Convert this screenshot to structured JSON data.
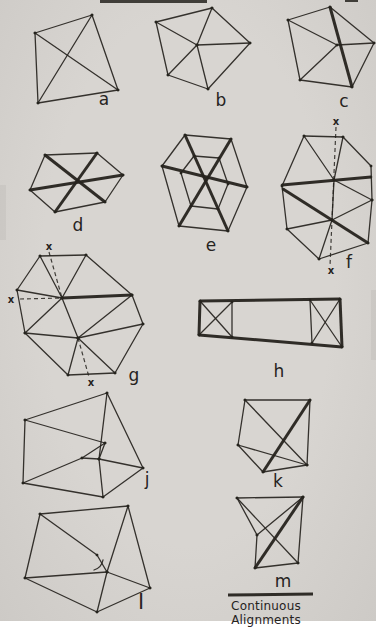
{
  "page": {
    "paper_color": "#d6d3cf",
    "ink_color": "#26231e"
  },
  "legend": {
    "label": "Continuous Alignments",
    "line": [
      228,
      595,
      313,
      594
    ]
  },
  "figures": [
    {
      "id": "a",
      "label": "a",
      "label_x": 104,
      "label_y": 99,
      "thin": [
        [
          92,
          15,
          35,
          33
        ],
        [
          35,
          33,
          38,
          103
        ],
        [
          38,
          103,
          118,
          90
        ],
        [
          118,
          90,
          92,
          15
        ],
        [
          92,
          15,
          38,
          103
        ],
        [
          35,
          33,
          118,
          90
        ]
      ]
    },
    {
      "id": "b",
      "label": "b",
      "label_x": 221,
      "label_y": 100,
      "thin": [
        [
          212,
          8,
          250,
          43
        ],
        [
          250,
          43,
          208,
          89
        ],
        [
          208,
          89,
          168,
          75
        ],
        [
          168,
          75,
          156,
          22
        ],
        [
          156,
          22,
          212,
          8
        ],
        [
          197,
          45,
          212,
          8
        ],
        [
          197,
          45,
          156,
          22
        ],
        [
          197,
          45,
          250,
          43
        ],
        [
          197,
          45,
          208,
          89
        ],
        [
          197,
          45,
          168,
          75
        ]
      ]
    },
    {
      "id": "c",
      "label": "c",
      "label_x": 344,
      "label_y": 101,
      "thin": [
        [
          330,
          7,
          374,
          43
        ],
        [
          374,
          43,
          352,
          87
        ],
        [
          352,
          87,
          300,
          80
        ],
        [
          300,
          80,
          288,
          20
        ],
        [
          288,
          20,
          330,
          7
        ],
        [
          337,
          45,
          288,
          20
        ],
        [
          337,
          45,
          374,
          43
        ],
        [
          337,
          45,
          300,
          80
        ]
      ],
      "thick": [
        [
          330,
          7,
          352,
          87
        ]
      ]
    },
    {
      "id": "d",
      "label": "d",
      "label_x": 78,
      "label_y": 225,
      "thin": [
        [
          45,
          155,
          97,
          153
        ],
        [
          97,
          153,
          123,
          175
        ],
        [
          123,
          175,
          105,
          202
        ],
        [
          105,
          202,
          55,
          212
        ],
        [
          55,
          212,
          30,
          190
        ],
        [
          30,
          190,
          45,
          155
        ]
      ],
      "thick": [
        [
          45,
          155,
          105,
          202
        ],
        [
          97,
          153,
          55,
          212
        ],
        [
          30,
          190,
          123,
          175
        ]
      ]
    },
    {
      "id": "e",
      "label": "e",
      "label_x": 211,
      "label_y": 245,
      "thin": [
        [
          185,
          135,
          231,
          139
        ],
        [
          231,
          139,
          247,
          187
        ],
        [
          247,
          187,
          228,
          231
        ],
        [
          228,
          231,
          179,
          226
        ],
        [
          179,
          226,
          162,
          166
        ],
        [
          162,
          166,
          185,
          135
        ],
        [
          194,
          156,
          219,
          158
        ],
        [
          219,
          158,
          228,
          184
        ],
        [
          228,
          184,
          218,
          209
        ],
        [
          218,
          209,
          191,
          206
        ],
        [
          191,
          206,
          181,
          173
        ],
        [
          181,
          173,
          194,
          156
        ]
      ],
      "thick": [
        [
          185,
          135,
          228,
          231
        ],
        [
          231,
          139,
          179,
          226
        ],
        [
          162,
          166,
          247,
          187
        ]
      ]
    },
    {
      "id": "f",
      "label": "f",
      "label_x": 349,
      "label_y": 262,
      "thin": [
        [
          304,
          136,
          343,
          137
        ],
        [
          343,
          137,
          371,
          166
        ],
        [
          371,
          166,
          372,
          200
        ],
        [
          372,
          200,
          368,
          243
        ],
        [
          368,
          243,
          319,
          259
        ],
        [
          319,
          259,
          287,
          229
        ],
        [
          287,
          229,
          282,
          186
        ],
        [
          282,
          186,
          304,
          136
        ],
        [
          334,
          180,
          304,
          136
        ],
        [
          334,
          180,
          343,
          137
        ],
        [
          334,
          180,
          372,
          200
        ],
        [
          334,
          180,
          332,
          220
        ],
        [
          332,
          220,
          372,
          200
        ],
        [
          332,
          220,
          319,
          259
        ],
        [
          332,
          220,
          287,
          229
        ]
      ],
      "thick": [
        [
          282,
          185,
          371,
          177
        ],
        [
          283,
          189,
          368,
          243
        ]
      ],
      "dashed": [
        [
          336,
          127,
          330,
          266
        ]
      ],
      "marks": [
        {
          "t": "x",
          "x": 336,
          "y": 121
        },
        {
          "t": "x",
          "x": 331,
          "y": 270
        }
      ]
    },
    {
      "id": "g",
      "label": "g",
      "label_x": 134,
      "label_y": 375,
      "thin": [
        [
          40,
          256,
          86,
          255
        ],
        [
          86,
          255,
          132,
          295
        ],
        [
          132,
          295,
          143,
          324
        ],
        [
          143,
          324,
          115,
          373
        ],
        [
          115,
          373,
          68,
          375
        ],
        [
          68,
          375,
          25,
          333
        ],
        [
          25,
          333,
          17,
          290
        ],
        [
          17,
          290,
          40,
          256
        ],
        [
          62,
          298,
          40,
          256
        ],
        [
          62,
          298,
          86,
          255
        ],
        [
          62,
          298,
          17,
          290
        ],
        [
          62,
          298,
          25,
          333
        ],
        [
          62,
          298,
          78,
          338
        ],
        [
          78,
          338,
          25,
          333
        ],
        [
          78,
          338,
          68,
          375
        ],
        [
          78,
          338,
          115,
          373
        ],
        [
          78,
          338,
          143,
          324
        ],
        [
          78,
          338,
          132,
          295
        ]
      ],
      "thick": [
        [
          62,
          298,
          132,
          295
        ]
      ],
      "dashed": [
        [
          49,
          252,
          62,
          298
        ],
        [
          20,
          299,
          62,
          298
        ],
        [
          78,
          338,
          89,
          377
        ]
      ],
      "marks": [
        {
          "t": "x",
          "x": 49,
          "y": 246
        },
        {
          "t": "x",
          "x": 11,
          "y": 299
        },
        {
          "t": "x",
          "x": 91,
          "y": 382
        }
      ]
    },
    {
      "id": "h",
      "label": "h",
      "label_x": 279,
      "label_y": 371,
      "thin": [
        [
          232,
          302,
          232,
          337
        ],
        [
          310,
          300,
          312,
          343
        ],
        [
          200,
          301,
          232,
          337
        ],
        [
          232,
          302,
          199,
          335
        ],
        [
          310,
          300,
          342,
          347
        ],
        [
          340,
          299,
          312,
          343
        ]
      ],
      "thick": [
        [
          200,
          301,
          340,
          299
        ],
        [
          340,
          299,
          342,
          347
        ],
        [
          342,
          347,
          199,
          335
        ],
        [
          199,
          335,
          200,
          301
        ]
      ]
    },
    {
      "id": "j",
      "label": "j",
      "label_x": 147,
      "label_y": 479,
      "thin": [
        [
          107,
          393,
          25,
          420
        ],
        [
          25,
          420,
          23,
          483
        ],
        [
          23,
          483,
          103,
          497
        ],
        [
          103,
          497,
          143,
          468
        ],
        [
          143,
          468,
          107,
          393
        ],
        [
          25,
          420,
          105,
          443
        ],
        [
          105,
          443,
          99,
          459
        ],
        [
          105,
          443,
          82,
          458
        ],
        [
          82,
          458,
          99,
          459
        ],
        [
          99,
          459,
          107,
          393
        ],
        [
          99,
          459,
          143,
          468
        ],
        [
          99,
          459,
          103,
          497
        ],
        [
          23,
          483,
          82,
          458
        ]
      ]
    },
    {
      "id": "k",
      "label": "k",
      "label_x": 278,
      "label_y": 481,
      "thin": [
        [
          245,
          400,
          310,
          400
        ],
        [
          310,
          400,
          307,
          465
        ],
        [
          307,
          465,
          263,
          472
        ],
        [
          263,
          472,
          238,
          445
        ],
        [
          238,
          445,
          245,
          400
        ],
        [
          245,
          400,
          307,
          465
        ],
        [
          238,
          445,
          307,
          465
        ]
      ],
      "thick": [
        [
          310,
          400,
          263,
          472
        ]
      ]
    },
    {
      "id": "l",
      "label": "l",
      "label_x": 141,
      "label_y": 601,
      "label_size": 22,
      "thin": [
        [
          40,
          514,
          128,
          506
        ],
        [
          128,
          506,
          150,
          588
        ],
        [
          150,
          588,
          97,
          612
        ],
        [
          97,
          612,
          25,
          578
        ],
        [
          25,
          578,
          40,
          514
        ],
        [
          40,
          514,
          97,
          555
        ],
        [
          97,
          555,
          107,
          572
        ],
        [
          107,
          572,
          128,
          506
        ],
        [
          107,
          572,
          150,
          588
        ],
        [
          107,
          572,
          97,
          612
        ],
        [
          25,
          578,
          107,
          572
        ]
      ],
      "arcs": [
        "M94,570 A13,13 0 0 0 103,560"
      ]
    },
    {
      "id": "m",
      "label": "m",
      "label_x": 283,
      "label_y": 581,
      "thin": [
        [
          237,
          498,
          303,
          497
        ],
        [
          303,
          497,
          298,
          563
        ],
        [
          298,
          563,
          255,
          568
        ],
        [
          255,
          568,
          257,
          535
        ],
        [
          257,
          535,
          237,
          498
        ],
        [
          237,
          498,
          298,
          563
        ],
        [
          257,
          535,
          303,
          497
        ]
      ],
      "thick": [
        [
          303,
          497,
          255,
          568
        ]
      ]
    }
  ]
}
